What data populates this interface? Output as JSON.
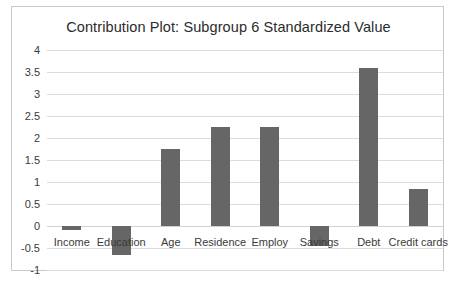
{
  "chart_data": {
    "type": "bar",
    "title": "Contribution Plot: Subgroup 6 Standardized Value",
    "xlabel": "",
    "ylabel": "",
    "categories": [
      "Income",
      "Education",
      "Age",
      "Residence",
      "Employ",
      "Savings",
      "Debt",
      "Credit cards"
    ],
    "values": [
      -0.1,
      -0.65,
      1.75,
      2.25,
      2.25,
      -0.45,
      3.6,
      0.85
    ],
    "ylim": [
      -1,
      4
    ],
    "ytick_step": 0.5,
    "ytick_labels": [
      "4",
      "3.5",
      "3",
      "2.5",
      "2",
      "1.5",
      "1",
      "0.5",
      "0",
      "-0.5",
      "-1"
    ],
    "ytick_values": [
      4,
      3.5,
      3,
      2.5,
      2,
      1.5,
      1,
      0.5,
      0,
      -0.5,
      -1
    ],
    "grid": true,
    "legend": false,
    "bar_color": "#666666",
    "gridline_color": "#dcdcdc",
    "border_color": "#c9c9c9",
    "background_color": "#ffffff",
    "text_color": "#3a3a3a"
  }
}
